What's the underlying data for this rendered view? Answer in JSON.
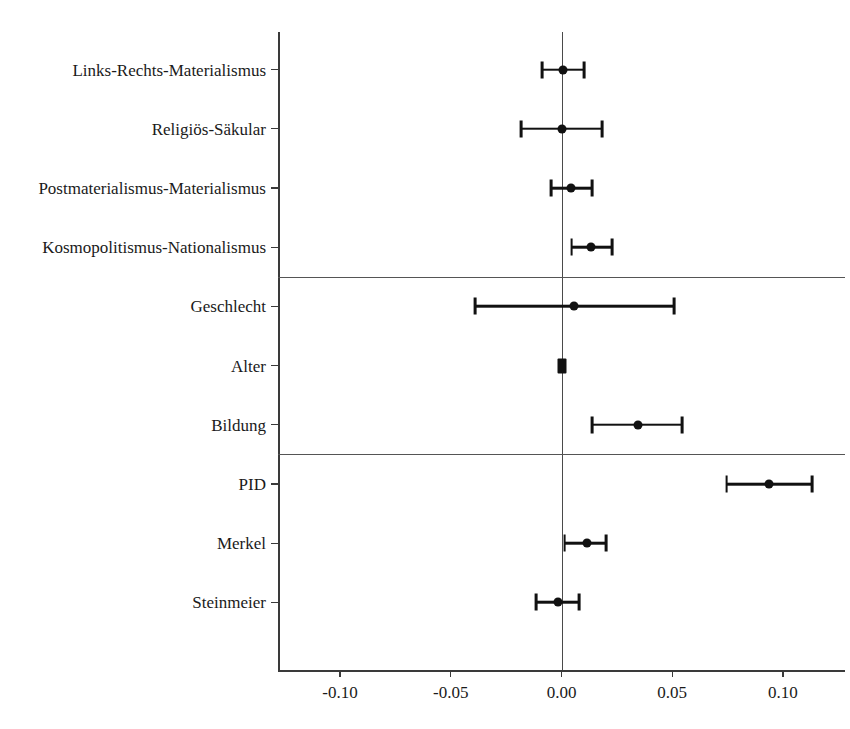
{
  "chart_data": {
    "type": "scatter",
    "subtype": "coefficient-plot",
    "title": "",
    "xlabel": "",
    "ylabel": "",
    "xlim": [
      -0.128,
      0.128
    ],
    "xticks": [
      -0.1,
      -0.05,
      0.0,
      0.05,
      0.1
    ],
    "xticklabels": [
      "-0.10",
      "-0.05",
      "0.00",
      "0.05",
      "0.10"
    ],
    "grid": false,
    "legend": null,
    "reference_line": 0.0,
    "panel_separators": [
      4,
      7
    ],
    "categories": [
      "Links-Rechts-Materialismus",
      "Religiös-Säkular",
      "Postmaterialismus-Materialismus",
      "Kosmopolitismus-Nationalismus",
      "Geschlecht",
      "Alter",
      "Bildung",
      "PID",
      "Merkel",
      "Steinmeier"
    ],
    "estimates": [
      0.0005,
      0.0,
      0.0045,
      0.0135,
      0.0055,
      0.0,
      0.0347,
      0.0935,
      0.0116,
      -0.0014
    ],
    "ci_low": [
      -0.0087,
      -0.0183,
      -0.0046,
      0.0046,
      -0.039,
      -0.0014,
      0.0139,
      0.0745,
      0.0014,
      -0.0116
    ],
    "ci_high": [
      0.0101,
      0.0183,
      0.0137,
      0.0229,
      0.0508,
      0.0014,
      0.0546,
      0.113,
      0.0202,
      0.0079
    ],
    "groups": [
      {
        "name": "Werteorientierungen",
        "rows": [
          0,
          1,
          2,
          3
        ]
      },
      {
        "name": "Soziodemographie",
        "rows": [
          4,
          5,
          6
        ]
      },
      {
        "name": "Politische Prädispositionen",
        "rows": [
          7,
          8,
          9
        ]
      }
    ]
  },
  "figure": {
    "marker_color": "#111111",
    "axis_color": "#3a3a3a",
    "background": "#ffffff"
  }
}
